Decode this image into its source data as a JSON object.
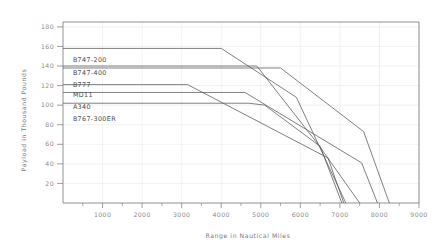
{
  "chart_data": {
    "type": "line",
    "title": "",
    "xlabel": "Range in Nautical Miles",
    "ylabel": "Payload in Thousand Pounds",
    "xlim": [
      0,
      9000
    ],
    "ylim": [
      0,
      185
    ],
    "grid": true,
    "legend_position": "inline-left",
    "x_ticks": [
      1000,
      2000,
      3000,
      4000,
      5000,
      6000,
      7000,
      8000,
      9000
    ],
    "x_tick_labels": [
      "1000",
      "2000",
      "3000",
      "4000",
      "5000",
      "6000",
      "7000",
      "8000",
      "9000"
    ],
    "x_minor_tick_step": 500,
    "y_ticks": [
      20,
      40,
      60,
      80,
      100,
      120,
      140,
      160,
      180
    ],
    "y_tick_labels": [
      "20",
      "40",
      "60",
      "80",
      "100",
      "120",
      "140",
      "160",
      "180"
    ],
    "series": [
      {
        "name": "B747-200",
        "label": "B747-200",
        "label_x": 250,
        "label_y": 144,
        "color": "#555555",
        "points": [
          [
            0,
            158
          ],
          [
            4000,
            158
          ],
          [
            5900,
            108
          ],
          [
            7150,
            0
          ]
        ]
      },
      {
        "name": "B747-400",
        "label": "B747-400",
        "label_x": 250,
        "label_y": 131,
        "color": "#555555",
        "points": [
          [
            0,
            140
          ],
          [
            4900,
            140
          ],
          [
            6450,
            60
          ],
          [
            7500,
            0
          ]
        ]
      },
      {
        "name": "B777",
        "label": "B777",
        "label_x": 250,
        "label_y": 119,
        "color": "#555555",
        "points": [
          [
            0,
            138
          ],
          [
            5500,
            138
          ],
          [
            7600,
            73
          ],
          [
            8250,
            0
          ]
        ]
      },
      {
        "name": "MD11",
        "label": "MD11",
        "label_x": 250,
        "label_y": 108,
        "color": "#555555",
        "points": [
          [
            0,
            121
          ],
          [
            3150,
            121
          ],
          [
            6700,
            46
          ],
          [
            7100,
            0
          ]
        ]
      },
      {
        "name": "A340",
        "label": "A340",
        "label_x": 250,
        "label_y": 96,
        "color": "#555555",
        "points": [
          [
            0,
            113
          ],
          [
            4600,
            113
          ],
          [
            7550,
            41
          ],
          [
            7950,
            0
          ]
        ]
      },
      {
        "name": "B767-300ER",
        "label": "B767-300ER",
        "label_x": 250,
        "label_y": 84,
        "color": "#555555",
        "points": [
          [
            0,
            102
          ],
          [
            4700,
            102
          ],
          [
            5100,
            100
          ],
          [
            6500,
            58
          ],
          [
            7050,
            0
          ]
        ]
      }
    ],
    "colors": {
      "background": "#ffffff",
      "axis": "#767676",
      "grid": "#e9e9e9",
      "line": "#555555",
      "tick_text": "#8a8a8a",
      "axis_title_text": "#7a7a7a",
      "series_label_text": "#4a4a4a"
    }
  }
}
